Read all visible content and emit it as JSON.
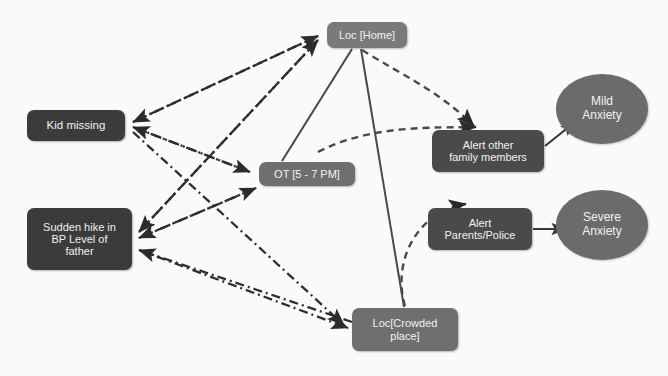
{
  "diagram": {
    "background_color": "#fbfaf8",
    "node_fill_dark": "#3b3b3b",
    "node_fill_mid": "#6f6f6f",
    "node_fill_light": "#7a7a7a",
    "node_text_color": "#f2f1ef",
    "edge_color": "#2e2e2e"
  },
  "nodes": {
    "kid_missing": {
      "label": "Kid  missing",
      "shape": "rounded-rect"
    },
    "bp_hike": {
      "line1": "Sudden hike in",
      "line2": "BP Level of",
      "line3": "father",
      "shape": "rounded-rect"
    },
    "loc_home": {
      "label": "Loc [Home]",
      "shape": "rounded-rect"
    },
    "ot_window": {
      "label": "OT [5 - 7 PM]",
      "shape": "rounded-rect"
    },
    "loc_crowded": {
      "line1": "Loc[Crowded",
      "line2": "place]",
      "shape": "rounded-rect"
    },
    "alert_family": {
      "line1": "Alert  other",
      "line2": "family members",
      "shape": "rounded-rect"
    },
    "alert_police": {
      "line1": "Alert",
      "line2": "Parents/Police",
      "shape": "rounded-rect"
    },
    "mild_anxiety": {
      "line1": "Mild",
      "line2": "Anxiety",
      "shape": "ellipse"
    },
    "severe_anxiety": {
      "line1": "Severe",
      "line2": "Anxiety",
      "shape": "ellipse"
    }
  },
  "edges": [
    {
      "from": "kid_missing",
      "to": "loc_home",
      "style": "dash-dot",
      "arrow": "both"
    },
    {
      "from": "kid_missing",
      "to": "ot_window",
      "style": "dash-dot",
      "arrow": "both"
    },
    {
      "from": "kid_missing",
      "to": "loc_crowded",
      "style": "dash-dot",
      "arrow": "both"
    },
    {
      "from": "bp_hike",
      "to": "loc_home",
      "style": "dash-dot",
      "arrow": "both"
    },
    {
      "from": "bp_hike",
      "to": "ot_window",
      "style": "dash-dot",
      "arrow": "both"
    },
    {
      "from": "bp_hike",
      "to": "loc_crowded",
      "style": "dash-dot",
      "arrow": "both"
    },
    {
      "from": "loc_home",
      "to": "ot_window",
      "style": "solid",
      "arrow": "none"
    },
    {
      "from": "loc_home",
      "to": "loc_crowded",
      "style": "solid",
      "arrow": "none"
    },
    {
      "from": "loc_home",
      "to": "alert_family",
      "style": "dashed",
      "arrow": "to"
    },
    {
      "from": "ot_window",
      "to": "alert_family",
      "style": "dashed",
      "arrow": "to"
    },
    {
      "from": "loc_crowded",
      "to": "alert_police",
      "style": "dashed",
      "arrow": "to"
    },
    {
      "from": "alert_family",
      "to": "mild_anxiety",
      "style": "solid",
      "arrow": "to"
    },
    {
      "from": "alert_police",
      "to": "severe_anxiety",
      "style": "solid",
      "arrow": "to"
    }
  ],
  "background_artifacts": {
    "line1": "show-through text line one",
    "line2": "show-through text line two",
    "line3": "show-through text line three"
  }
}
